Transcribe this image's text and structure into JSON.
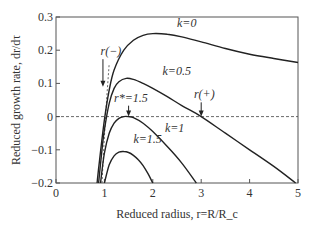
{
  "chart_data": {
    "type": "line",
    "title": "",
    "xlabel": "Reduced radius, r=R/R_c",
    "ylabel": "Reduced growth rate, dr/dτ",
    "xlim": [
      0,
      5
    ],
    "ylim": [
      -0.2,
      0.3
    ],
    "xticks": [
      0,
      1,
      2,
      3,
      4,
      5
    ],
    "yticks": [
      -0.2,
      -0.1,
      0,
      0.1,
      0.2,
      0.3
    ],
    "xtick_labels": [
      "0",
      "1",
      "2",
      "3",
      "4",
      "5"
    ],
    "ytick_labels": [
      "−0.2",
      "−0.1",
      "0",
      "0.1",
      "0.2",
      "0.3"
    ],
    "grid": false,
    "legend": null,
    "series": [
      {
        "name": "k=0",
        "label": "k=0",
        "x": [
          0.85,
          0.9,
          1.0,
          1.1,
          1.2,
          1.4,
          1.6,
          1.8,
          2.0,
          2.3,
          2.6,
          3.0,
          3.5,
          4.0,
          4.5,
          5.0
        ],
        "y": [
          -0.2,
          -0.13,
          -0.01,
          0.08,
          0.14,
          0.2,
          0.23,
          0.245,
          0.25,
          0.248,
          0.24,
          0.225,
          0.205,
          0.188,
          0.175,
          0.163
        ]
      },
      {
        "name": "k=0.5",
        "label": "k=0.5",
        "x": [
          0.88,
          0.95,
          1.0,
          1.1,
          1.2,
          1.3,
          1.45,
          1.6,
          1.8,
          2.0,
          2.3,
          2.6,
          3.0,
          3.5,
          4.0,
          4.5,
          4.95
        ],
        "y": [
          -0.2,
          -0.1,
          -0.04,
          0.04,
          0.085,
          0.105,
          0.115,
          0.112,
          0.1,
          0.085,
          0.06,
          0.033,
          0.0,
          -0.05,
          -0.1,
          -0.15,
          -0.2
        ]
      },
      {
        "name": "k=1",
        "label": "k=1",
        "x": [
          0.92,
          1.0,
          1.1,
          1.2,
          1.3,
          1.4,
          1.5,
          1.6,
          1.8,
          2.0,
          2.3,
          2.6,
          2.9
        ],
        "y": [
          -0.2,
          -0.11,
          -0.05,
          -0.02,
          -0.005,
          0.0,
          0.0,
          -0.003,
          -0.02,
          -0.045,
          -0.09,
          -0.14,
          -0.2
        ]
      },
      {
        "name": "k=1.5",
        "label": "k=1.5",
        "x": [
          1.0,
          1.1,
          1.2,
          1.3,
          1.4,
          1.5,
          1.6,
          1.7,
          1.8,
          1.9,
          2.0
        ],
        "y": [
          -0.2,
          -0.145,
          -0.118,
          -0.107,
          -0.105,
          -0.108,
          -0.117,
          -0.13,
          -0.148,
          -0.172,
          -0.2
        ]
      }
    ],
    "reference_lines": [
      {
        "type": "horizontal",
        "y": 0,
        "style": "dashed"
      },
      {
        "type": "curve",
        "name": "r(-) locus",
        "style": "dashed",
        "x": [
          0.95,
          1.0,
          1.05,
          1.1
        ],
        "y": [
          -0.2,
          -0.06,
          0.06,
          0.16
        ]
      }
    ],
    "annotations": [
      {
        "text": "k=0",
        "x": 2.5,
        "y": 0.27
      },
      {
        "text": "k=0.5",
        "x": 2.2,
        "y": 0.125
      },
      {
        "text": "k=1",
        "x": 2.25,
        "y": -0.045
      },
      {
        "text": "k=1.5",
        "x": 1.6,
        "y": -0.08
      },
      {
        "text": "r(−)",
        "x": 0.92,
        "y": 0.185,
        "arrow_to": [
          0.97,
          0.09
        ]
      },
      {
        "text": "r*=1.5",
        "x": 1.2,
        "y": 0.045,
        "arrow_to": [
          1.5,
          0.0
        ]
      },
      {
        "text": "r(+)",
        "x": 2.85,
        "y": 0.055,
        "arrow_to": [
          3.0,
          0.0
        ]
      }
    ]
  }
}
